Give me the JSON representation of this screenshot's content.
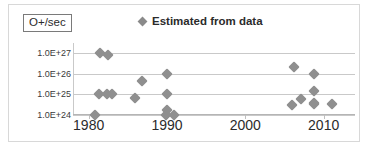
{
  "chart_data": {
    "type": "scatter",
    "title": "",
    "xlabel": "",
    "ylabel": "O+/sec",
    "ylabel_boxed": true,
    "xlim": [
      1978,
      2014
    ],
    "ylim": [
      1e+24,
      3e+27
    ],
    "yscale": "log",
    "grid": true,
    "grid_axis": "y",
    "legend_position": "top-center",
    "xticks": [
      "1980",
      "1990",
      "2000",
      "2010"
    ],
    "xtick_values": [
      1980,
      1990,
      2000,
      2010
    ],
    "yticks": [
      "1.0E+24",
      "1.0E+25",
      "1.0E+26",
      "1.0E+27"
    ],
    "ytick_values": [
      1e+24,
      1e+25,
      1e+26,
      1e+27
    ],
    "marker": "diamond",
    "marker_color": "#8f8f8f",
    "series": [
      {
        "name": "Estimated from data",
        "points": [
          {
            "x": 1981.4,
            "y": 1e+27
          },
          {
            "x": 1982.5,
            "y": 8e+26
          },
          {
            "x": 1981.3,
            "y": 1e+25
          },
          {
            "x": 1982.4,
            "y": 1e+25
          },
          {
            "x": 1983.0,
            "y": 1e+25
          },
          {
            "x": 1980.8,
            "y": 1e+24
          },
          {
            "x": 1986.8,
            "y": 4.5e+25
          },
          {
            "x": 1985.9,
            "y": 6.5e+24
          },
          {
            "x": 1990.0,
            "y": 1e+26
          },
          {
            "x": 1990.0,
            "y": 1e+25
          },
          {
            "x": 1990.0,
            "y": 1.8e+24
          },
          {
            "x": 1989.9,
            "y": 1e+24
          },
          {
            "x": 1990.9,
            "y": 1e+24
          },
          {
            "x": 2006.2,
            "y": 2e+26
          },
          {
            "x": 2008.8,
            "y": 1e+26
          },
          {
            "x": 2008.8,
            "y": 1.5e+25
          },
          {
            "x": 2007.1,
            "y": 6e+24
          },
          {
            "x": 2005.9,
            "y": 3.2e+24
          },
          {
            "x": 2008.8,
            "y": 4e+24
          },
          {
            "x": 2008.8,
            "y": 3.4e+24
          },
          {
            "x": 2011.1,
            "y": 3.4e+24
          }
        ]
      }
    ]
  },
  "legend": {
    "label": "Estimated from data",
    "marker_name": "diamond-marker"
  },
  "axes": {
    "y_title": "O+/sec"
  }
}
